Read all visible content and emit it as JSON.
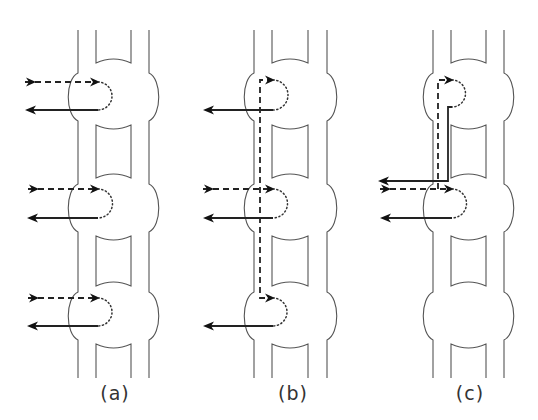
{
  "figure": {
    "colors": {
      "wall": "#555555",
      "arrow": "#222222",
      "background": "#ffffff"
    },
    "top_y": 30,
    "bottom_y": 378,
    "bulge_centers_y": [
      97,
      208,
      316
    ],
    "panels": [
      {
        "id": "a",
        "label": "(a)",
        "label_x": 115,
        "walls": {
          "outer_left": 78,
          "inner_left": 96,
          "inner_right": 131,
          "outer_right": 149
        },
        "loops": [
          {
            "bulge": 0,
            "in_y": 82,
            "out_y": 110,
            "in_start_x": 25,
            "out_end_x": 25
          },
          {
            "bulge": 1,
            "in_y": 189,
            "out_y": 218,
            "in_start_x": 28,
            "out_end_x": 27
          },
          {
            "bulge": 2,
            "in_y": 298,
            "out_y": 326,
            "in_start_x": 28,
            "out_end_x": 27
          }
        ],
        "description": "Each unit has its own input (dashed) and output (solid) crossing one bulge"
      },
      {
        "id": "b",
        "label": "(b)",
        "label_x": 293,
        "walls": {
          "outer_left": 254,
          "inner_left": 272,
          "inner_right": 308,
          "outer_right": 327
        },
        "bus": {
          "x": 260,
          "top_y": 80,
          "bottom_y": 298,
          "entry_y": 189,
          "entry_start_x": 203
        },
        "outputs": [
          {
            "bulge": 0,
            "y": 110,
            "end_x": 203
          },
          {
            "bulge": 1,
            "y": 218,
            "end_x": 203
          },
          {
            "bulge": 2,
            "y": 326,
            "end_x": 203
          }
        ],
        "description": "Single central input distributed up and down along a dashed bus to all three bulges"
      },
      {
        "id": "c",
        "label": "(c)",
        "label_x": 470,
        "walls": {
          "outer_left": 433,
          "inner_left": 451,
          "inner_right": 486,
          "outer_right": 504
        },
        "bus": {
          "x": 438,
          "top_y": 80,
          "entry_y": 189,
          "entry_start_x": 380
        },
        "return": {
          "x": 448,
          "from_y": 107,
          "out_y": 181,
          "end_x": 378
        },
        "outputs": [
          {
            "bulge": 1,
            "y": 218,
            "end_x": 380
          }
        ],
        "description": "Input enters middle bulge, branches up to top bulge; top bulge returns via solid path; bottom bulge unused"
      }
    ]
  }
}
